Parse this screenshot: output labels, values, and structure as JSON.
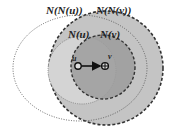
{
  "diagram": {
    "labels": {
      "nnu": "N(N(u))",
      "nnv": "N(N(v))",
      "nu": "N(u)",
      "nv": "N(v)",
      "u": "u",
      "v": "v"
    },
    "colors": {
      "nnv_fill": "#c4c4c4",
      "nu_fill": "#d2d2d2",
      "nv_fill": "#9a9a9a",
      "stroke": "#333333"
    }
  }
}
